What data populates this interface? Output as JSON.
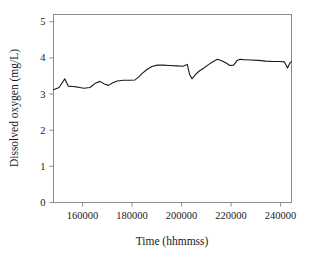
{
  "chart_data": {
    "type": "line",
    "title": "",
    "xlabel": "Time (hhmmss)",
    "ylabel": "Dissolved oxygen (mg/L)",
    "xlim": [
      148250,
      244400
    ],
    "ylim": [
      0,
      5.2
    ],
    "xticks": [
      160000,
      180000,
      200000,
      220000,
      240000
    ],
    "xtick_labels": [
      "160000",
      "180000",
      "200000",
      "220000",
      "240000"
    ],
    "yticks": [
      0,
      1,
      2,
      3,
      4,
      5
    ],
    "ytick_labels": [
      "0",
      "1",
      "2",
      "3",
      "4",
      "5"
    ],
    "grid": false,
    "legend": null,
    "line_color": "#1a1a1a",
    "line_width": 1.1,
    "frame_color": "#8c8c8c",
    "series": [
      {
        "name": "Dissolved oxygen",
        "x": [
          148250,
          150500,
          152800,
          154200,
          156000,
          158200,
          160500,
          163000,
          165200,
          167000,
          168800,
          170500,
          172200,
          174000,
          176500,
          179000,
          181200,
          182600,
          184200,
          186000,
          188000,
          190200,
          192500,
          195000,
          198000,
          200500,
          202300,
          203200,
          204200,
          205500,
          207000,
          209000,
          211000,
          212800,
          214500,
          216200,
          218000,
          219500,
          221000,
          222500,
          223600,
          225500,
          228000,
          231000,
          234000,
          237000,
          239500,
          241500,
          242800,
          243600,
          244400
        ],
        "y": [
          3.12,
          3.18,
          3.42,
          3.22,
          3.21,
          3.19,
          3.16,
          3.18,
          3.3,
          3.35,
          3.28,
          3.24,
          3.31,
          3.36,
          3.38,
          3.38,
          3.39,
          3.47,
          3.58,
          3.68,
          3.76,
          3.8,
          3.8,
          3.79,
          3.78,
          3.77,
          3.82,
          3.55,
          3.42,
          3.53,
          3.63,
          3.72,
          3.82,
          3.9,
          3.96,
          3.92,
          3.86,
          3.79,
          3.8,
          3.93,
          3.96,
          3.95,
          3.94,
          3.93,
          3.91,
          3.9,
          3.9,
          3.89,
          3.72,
          3.84,
          3.9
        ]
      }
    ]
  },
  "axes": {
    "x_title": "Time (hhmmss)",
    "y_title": "Dissolved oxygen (mg/L)"
  }
}
